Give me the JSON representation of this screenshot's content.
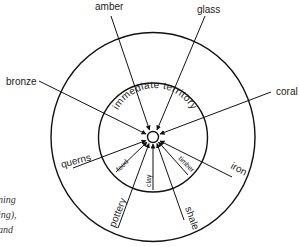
{
  "diagram": {
    "center_label": "",
    "inner_zone_label": "immediate territory",
    "outer_resources": [
      {
        "id": "amber",
        "label": "amber"
      },
      {
        "id": "glass",
        "label": "glass"
      },
      {
        "id": "bronze",
        "label": "bronze"
      },
      {
        "id": "coral",
        "label": "coral"
      },
      {
        "id": "querns",
        "label": "querns"
      },
      {
        "id": "iron",
        "label": "iron"
      },
      {
        "id": "pottery",
        "label": "pottery"
      },
      {
        "id": "shale",
        "label": "shale"
      }
    ],
    "local_resources": [
      {
        "id": "food",
        "label": "food"
      },
      {
        "id": "clay",
        "label": "clay"
      },
      {
        "id": "timber",
        "label": "timber"
      }
    ]
  },
  "caption_fragments": [
    "t",
    "ning",
    "ing),",
    "and"
  ]
}
